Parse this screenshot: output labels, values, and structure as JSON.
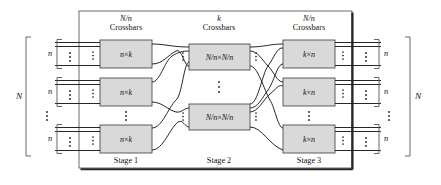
{
  "figure": {
    "type": "diagram",
    "headers": [
      {
        "id": "stage1-header",
        "line1_var": "N/n",
        "line2": "Crossbars"
      },
      {
        "id": "stage2-header",
        "line1_var": "k",
        "line2": "Crossbars"
      },
      {
        "id": "stage3-header",
        "line1_var": "N/n",
        "line2": "Crossbars"
      }
    ],
    "stage_labels": [
      "Stage 1",
      "Stage 2",
      "Stage 3"
    ],
    "stage1_boxes": [
      {
        "label_left": "n",
        "times": "×",
        "label_right": "k"
      },
      {
        "label_left": "n",
        "times": "×",
        "label_right": "k"
      },
      {
        "label_left": "n",
        "times": "×",
        "label_right": "k"
      }
    ],
    "stage2_boxes": [
      {
        "label_left": "N/n",
        "times": "×",
        "label_right": "N/n"
      },
      {
        "label_left": "N/n",
        "times": "×",
        "label_right": "N/n"
      }
    ],
    "stage3_boxes": [
      {
        "label_left": "k",
        "times": "×",
        "label_right": "n"
      },
      {
        "label_left": "k",
        "times": "×",
        "label_right": "n"
      },
      {
        "label_left": "k",
        "times": "×",
        "label_right": "n"
      }
    ],
    "left_brackets": {
      "outer_label": "N",
      "inner_labels": [
        "n",
        "n",
        "n"
      ]
    },
    "right_brackets": {
      "outer_label": "N",
      "inner_labels": [
        "n",
        "n",
        "n"
      ]
    },
    "vertical_ellipsis": "⋮",
    "colors": {
      "box_fill": "#d9d9d9",
      "box_stroke": "#4d4d4d",
      "wire": "#1a1a1a",
      "frame": "#262626",
      "bracket": "#555555",
      "background": "#ffffff",
      "text": "#111111"
    }
  }
}
